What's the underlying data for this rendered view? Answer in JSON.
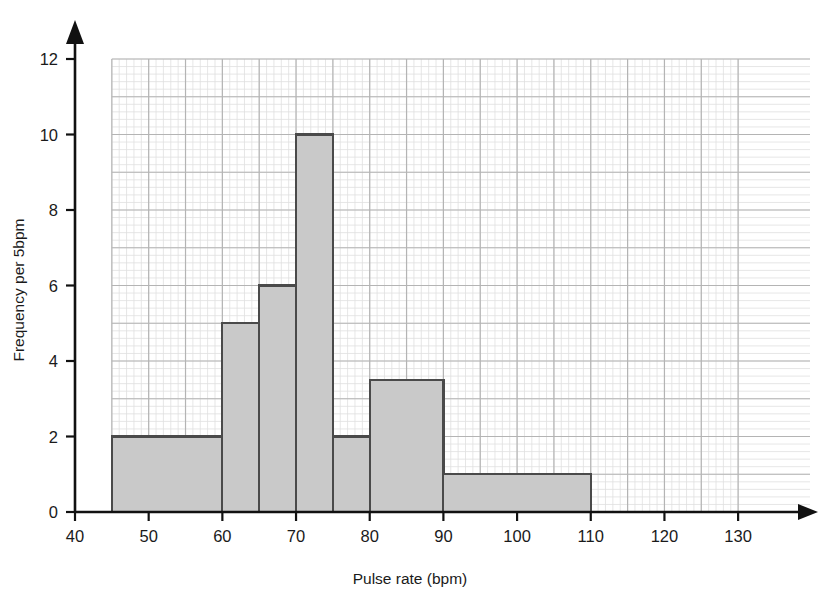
{
  "chart_data": {
    "type": "bar",
    "title": "",
    "subtitle": "",
    "xlabel": "Pulse rate (bpm)",
    "ylabel": "Frequency per 5bpm",
    "xlim": [
      40,
      135
    ],
    "ylim": [
      0,
      12.6
    ],
    "xticks": [
      40,
      50,
      60,
      70,
      80,
      90,
      100,
      110,
      120,
      130
    ],
    "yticks": [
      0,
      2,
      4,
      6,
      8,
      10,
      12
    ],
    "xtick_labels": [
      "40",
      "50",
      "60",
      "70",
      "80",
      "90",
      "100",
      "110",
      "120",
      "130"
    ],
    "ytick_labels": [
      "0",
      "2",
      "4",
      "6",
      "8",
      "10",
      "12"
    ],
    "grid": true,
    "minor_grid": true,
    "minor_grid_x_step": 1,
    "minor_grid_y_step": 0.2,
    "major_grid_x_step": 5,
    "major_grid_y_step": 1,
    "legend": null,
    "bins": [
      {
        "label": "45-60",
        "x0": 45,
        "x1": 60,
        "height": 2
      },
      {
        "label": "60-65",
        "x0": 60,
        "x1": 65,
        "height": 5
      },
      {
        "label": "65-70",
        "x0": 65,
        "x1": 70,
        "height": 6
      },
      {
        "label": "70-75",
        "x0": 70,
        "x1": 75,
        "height": 10
      },
      {
        "label": "75-80",
        "x0": 75,
        "x1": 80,
        "height": 2
      },
      {
        "label": "80-90",
        "x0": 80,
        "x1": 90,
        "height": 3.5
      },
      {
        "label": "90-110",
        "x0": 90,
        "x1": 110,
        "height": 1
      }
    ],
    "categories": [
      "45-60",
      "60-65",
      "65-70",
      "70-75",
      "75-80",
      "80-90",
      "90-110"
    ],
    "values": [
      2,
      5,
      6,
      10,
      2,
      3.5,
      1
    ],
    "colors": {
      "bar_fill": "#c9c9c9",
      "bar_stroke": "#4a4a4a",
      "axis": "#111111",
      "major_grid": "#b4b4b4",
      "minor_grid": "#dfdfdf",
      "text": "#1a1a1a",
      "background": "#ffffff"
    }
  }
}
